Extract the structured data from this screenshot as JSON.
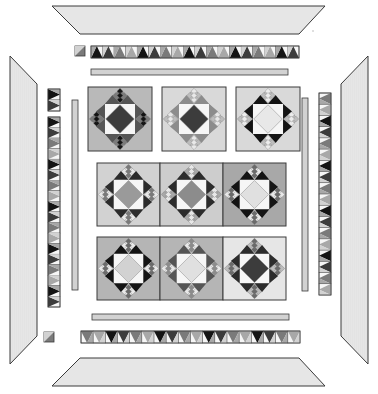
{
  "diagram": {
    "type": "quilt-assembly-exploded-view",
    "colors": {
      "background": "#ffffff",
      "border_fill": "#e6e6e6",
      "outline": "#3a3a3a",
      "black": "#141414",
      "dark": "#3c3c3c",
      "mid": "#7a7a7a",
      "midlight": "#a8a8a8",
      "light": "#d2d2d2",
      "white": "#f6f6f6"
    },
    "outer_borders": [
      {
        "side": "top",
        "shape": "trapezoid"
      },
      {
        "side": "bottom",
        "shape": "trapezoid"
      },
      {
        "side": "left",
        "shape": "trapezoid"
      },
      {
        "side": "right",
        "shape": "trapezoid"
      }
    ],
    "pieced_borders": [
      {
        "side": "top",
        "units": 18,
        "corner_square": true
      },
      {
        "side": "bottom",
        "units": 18,
        "corner_square": false
      },
      {
        "side": "left",
        "units": 18,
        "corner_square": true
      },
      {
        "side": "right",
        "units": 18,
        "corner_square": true
      }
    ],
    "inner_strips": [
      {
        "side": "top"
      },
      {
        "side": "bottom"
      },
      {
        "side": "left"
      },
      {
        "side": "right"
      }
    ],
    "block_rows": [
      {
        "row": 1,
        "blocks": [
          {
            "name": "block-1-1",
            "bg": "#b9b9b9",
            "center": "#3c3c3c",
            "star": "#555555",
            "ninepatch": "#141414",
            "alt": "#7a7a7a"
          },
          {
            "name": "block-1-2",
            "bg": "#d9d9d9",
            "center": "#3c3c3c",
            "star": "#8c8c8c",
            "ninepatch": "#e8e8e8",
            "alt": "#bdbdbd"
          },
          {
            "name": "block-1-3",
            "bg": "#d9d9d9",
            "center": "#e8e8e8",
            "star": "#141414",
            "ninepatch": "#ececec",
            "alt": "#bdbdbd"
          }
        ]
      },
      {
        "row": 2,
        "blocks": [
          {
            "name": "block-2-1",
            "bg": "#d2d2d2",
            "center": "#9a9a9a",
            "star": "#2c2c2c",
            "ninepatch": "#7a7a7a",
            "alt": "#e8e8e8"
          },
          {
            "name": "block-2-2",
            "bg": "#cdcdcd",
            "center": "#8c8c8c",
            "star": "#2c2c2c",
            "ninepatch": "#e8e8e8",
            "alt": "#a8a8a8"
          },
          {
            "name": "block-2-3",
            "bg": "#a8a8a8",
            "center": "#e0e0e0",
            "star": "#141414",
            "ninepatch": "#6a6a6a",
            "alt": "#e8e8e8"
          }
        ]
      },
      {
        "row": 3,
        "blocks": [
          {
            "name": "block-3-1",
            "bg": "#b5b5b5",
            "center": "#d2d2d2",
            "star": "#141414",
            "ninepatch": "#6a6a6a",
            "alt": "#e8e8e8"
          },
          {
            "name": "block-3-2",
            "bg": "#b5b5b5",
            "center": "#e0e0e0",
            "star": "#555555",
            "ninepatch": "#8c8c8c",
            "alt": "#e8e8e8"
          },
          {
            "name": "block-3-3",
            "bg": "#e6e6e6",
            "center": "#3c3c3c",
            "star": "#2c2c2c",
            "ninepatch": "#6a6a6a",
            "alt": "#bdbdbd"
          }
        ]
      }
    ]
  }
}
